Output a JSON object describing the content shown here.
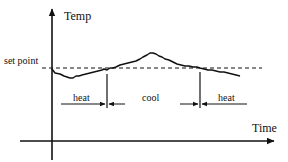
{
  "diagram": {
    "type": "thermostat-hysteresis",
    "y_axis_label": "Temp",
    "x_axis_label": "Time",
    "setpoint_label": "set point",
    "regions": [
      {
        "label": "heat",
        "x_start": 56,
        "x_end": 107
      },
      {
        "label": "cool",
        "x_start": 107,
        "x_end": 200
      },
      {
        "label": "heat",
        "x_start": 200,
        "x_end": 250
      }
    ],
    "colors": {
      "line": "#111111",
      "background": "#ffffff"
    }
  }
}
